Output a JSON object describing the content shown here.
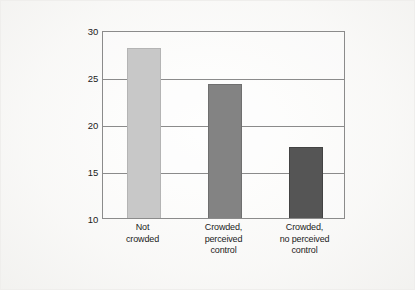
{
  "chart_data": {
    "type": "bar",
    "title": "",
    "subtitle": "",
    "xlabel": "",
    "ylabel": "Number of attempts to solve puzzles",
    "categories": [
      "Not crowded",
      "Crowded, perceived control",
      "Crowded, no perceived control"
    ],
    "category_lines": [
      [
        "Not",
        "crowded"
      ],
      [
        "Crowded,",
        "perceived",
        "control"
      ],
      [
        "Crowded,",
        "no perceived",
        "control"
      ]
    ],
    "values": [
      28.1,
      24.3,
      17.6
    ],
    "ylim": [
      10,
      30
    ],
    "yticks": [
      10,
      15,
      20,
      25,
      30
    ],
    "ytick_labels": [
      "10",
      "15",
      "20",
      "25",
      "30"
    ],
    "grid": true,
    "grid_axis": "y",
    "legend": "none",
    "bar_colors": [
      "#c8c8c8",
      "#838383",
      "#555555"
    ],
    "bar_edge_colors": [
      "#b4b4b4",
      "#6f6f6f",
      "#434343"
    ],
    "axis_color": "#8b8b8b",
    "text_color": "#1b1b1b",
    "background_color": "#fbfbfa"
  }
}
